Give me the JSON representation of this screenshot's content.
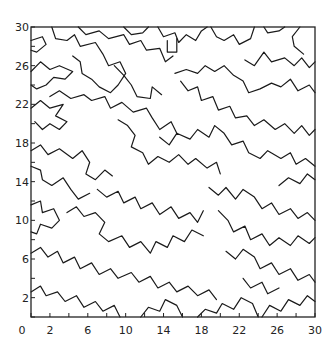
{
  "chart_data": {
    "type": "contour",
    "title": "",
    "xlabel": "",
    "ylabel": "",
    "xlim": [
      0,
      30
    ],
    "ylim": [
      0,
      30
    ],
    "grid": false,
    "legend": null,
    "x_ticks": [
      0,
      2,
      6,
      10,
      14,
      18,
      22,
      26,
      30
    ],
    "y_ticks": [
      2,
      6,
      10,
      14,
      18,
      22,
      26,
      30
    ],
    "x_tick_labels": [
      "0",
      "2",
      "6",
      "10",
      "14",
      "18",
      "22",
      "26",
      "30"
    ],
    "y_tick_labels": [
      "2",
      "6",
      "10",
      "14",
      "18",
      "22",
      "26",
      "30"
    ],
    "minor_tick_step": 2,
    "line_color": "#1a1a1a",
    "contours": [
      [
        [
          0,
          28.6
        ],
        [
          1.2,
          29
        ],
        [
          1.6,
          28.2
        ],
        [
          0.6,
          27.4
        ],
        [
          0,
          27.6
        ]
      ],
      [
        [
          0,
          25.4
        ],
        [
          1,
          26.4
        ],
        [
          2,
          25.6
        ],
        [
          3,
          26
        ],
        [
          4.4,
          25.4
        ],
        [
          3.6,
          24.6
        ],
        [
          2.4,
          24.8
        ],
        [
          1.6,
          24
        ],
        [
          0.6,
          23.6
        ],
        [
          0,
          24
        ]
      ],
      [
        [
          2.2,
          30
        ],
        [
          2.6,
          28.8
        ],
        [
          3.8,
          28.6
        ],
        [
          4.6,
          29.2
        ],
        [
          5.2,
          28
        ],
        [
          6.8,
          28.4
        ],
        [
          7.6,
          27.2
        ],
        [
          8.2,
          26
        ],
        [
          9.4,
          26.4
        ],
        [
          10,
          25.2
        ],
        [
          9.2,
          24
        ],
        [
          8.4,
          23.2
        ],
        [
          7.2,
          23.8
        ],
        [
          6.4,
          24.6
        ],
        [
          5.4,
          25.2
        ],
        [
          5.2,
          26.4
        ],
        [
          4.4,
          27
        ]
      ],
      [
        [
          5,
          30
        ],
        [
          5.8,
          29.2
        ],
        [
          7.2,
          29.6
        ],
        [
          8.2,
          28.8
        ],
        [
          9.8,
          29.2
        ],
        [
          10.4,
          28.2
        ],
        [
          11.6,
          28.6
        ],
        [
          12.2,
          27.6
        ],
        [
          13.6,
          27.8
        ],
        [
          14.2,
          26.4
        ],
        [
          15,
          27
        ]
      ],
      [
        [
          9.8,
          30
        ],
        [
          10.6,
          29.2
        ],
        [
          11.8,
          29.4
        ],
        [
          12.4,
          30
        ]
      ],
      [
        [
          13.4,
          30
        ],
        [
          14,
          29
        ],
        [
          15.2,
          29.4
        ],
        [
          15.6,
          28.4
        ],
        [
          16.4,
          29.2
        ],
        [
          17.4,
          28.6
        ],
        [
          18,
          29.6
        ],
        [
          18.6,
          30
        ]
      ],
      [
        [
          14.4,
          28.6
        ],
        [
          14.4,
          27.4
        ],
        [
          15.4,
          27.4
        ],
        [
          15.4,
          28.8
        ]
      ],
      [
        [
          19,
          30
        ],
        [
          19.6,
          29
        ],
        [
          20.4,
          28.6
        ],
        [
          21.4,
          29.2
        ],
        [
          22,
          28.2
        ],
        [
          23.2,
          28.8
        ],
        [
          23.6,
          30
        ]
      ],
      [
        [
          24.6,
          30
        ],
        [
          25,
          29.4
        ],
        [
          26.2,
          29.6
        ],
        [
          26.8,
          30
        ]
      ],
      [
        [
          28.4,
          30
        ],
        [
          27.6,
          29
        ],
        [
          27.8,
          28
        ],
        [
          28.8,
          27.2
        ]
      ],
      [
        [
          0,
          21.6
        ],
        [
          1,
          22.4
        ],
        [
          2,
          21.6
        ],
        [
          3.4,
          22
        ],
        [
          2.6,
          20.8
        ],
        [
          3.8,
          20.2
        ],
        [
          3,
          19.4
        ],
        [
          2,
          20
        ],
        [
          1.2,
          19.4
        ],
        [
          0.4,
          20.2
        ]
      ],
      [
        [
          2,
          22.8
        ],
        [
          3,
          23.4
        ],
        [
          4.2,
          22.6
        ],
        [
          5.6,
          23
        ],
        [
          6.4,
          22.4
        ],
        [
          7.8,
          22.8
        ],
        [
          8.4,
          21.6
        ],
        [
          9.6,
          22.2
        ],
        [
          10.8,
          21.2
        ],
        [
          12.2,
          21.6
        ],
        [
          12.8,
          20.6
        ],
        [
          13.6,
          19.4
        ],
        [
          14.8,
          20.2
        ],
        [
          15.4,
          19
        ]
      ],
      [
        [
          8.8,
          26
        ],
        [
          9.8,
          25
        ],
        [
          10.6,
          24
        ],
        [
          11.2,
          22.8
        ],
        [
          12.6,
          22.6
        ],
        [
          12.8,
          23.8
        ],
        [
          13.8,
          23
        ]
      ],
      [
        [
          15.2,
          25.2
        ],
        [
          16.4,
          25.6
        ],
        [
          17.6,
          25.2
        ],
        [
          18.4,
          26
        ],
        [
          19.4,
          25.4
        ],
        [
          20.4,
          26
        ],
        [
          21.4,
          25
        ],
        [
          22.4,
          24.4
        ],
        [
          23,
          23.2
        ],
        [
          24.2,
          23.6
        ],
        [
          25.4,
          24.2
        ],
        [
          26.4,
          23.8
        ],
        [
          27.4,
          24.6
        ],
        [
          28.2,
          23.4
        ],
        [
          29.4,
          24
        ],
        [
          30,
          23.2
        ]
      ],
      [
        [
          22.6,
          26.6
        ],
        [
          23.6,
          26
        ],
        [
          24.6,
          27.4
        ],
        [
          25.4,
          26.4
        ],
        [
          26.8,
          26.8
        ],
        [
          27.8,
          26
        ],
        [
          28.6,
          26.8
        ],
        [
          29.4,
          25.8
        ],
        [
          30,
          26.4
        ]
      ],
      [
        [
          15.8,
          24.4
        ],
        [
          16.6,
          23.4
        ],
        [
          17.6,
          23.8
        ],
        [
          18,
          22.4
        ],
        [
          19.2,
          22.8
        ],
        [
          19.8,
          21.4
        ],
        [
          21,
          21.8
        ],
        [
          21.6,
          20.6
        ],
        [
          22.8,
          20.8
        ],
        [
          23.6,
          19.8
        ],
        [
          24.6,
          20.4
        ],
        [
          25.8,
          19.4
        ],
        [
          26.8,
          20
        ],
        [
          27.8,
          19
        ],
        [
          28.6,
          19.8
        ],
        [
          29.4,
          18.8
        ],
        [
          30,
          19.4
        ]
      ],
      [
        [
          0,
          17.2
        ],
        [
          1,
          17.8
        ],
        [
          1.8,
          16.8
        ],
        [
          3,
          17.4
        ],
        [
          4.4,
          16.4
        ],
        [
          5.4,
          17.2
        ],
        [
          6.2,
          16
        ],
        [
          5.8,
          14.8
        ],
        [
          6.8,
          14.2
        ],
        [
          7.8,
          15.2
        ],
        [
          8.6,
          14.6
        ]
      ],
      [
        [
          0,
          15.6
        ],
        [
          1,
          15.2
        ],
        [
          1.2,
          14.2
        ],
        [
          2.2,
          13.6
        ],
        [
          3.4,
          14.4
        ],
        [
          4.2,
          13.2
        ],
        [
          5,
          12.2
        ],
        [
          6.2,
          12.8
        ]
      ],
      [
        [
          9.2,
          20.4
        ],
        [
          10.2,
          19.8
        ],
        [
          11,
          18.8
        ],
        [
          10.6,
          17.6
        ],
        [
          11.8,
          17
        ],
        [
          12.4,
          15.8
        ],
        [
          13.4,
          16.6
        ],
        [
          14.6,
          16
        ],
        [
          15.6,
          16.8
        ],
        [
          16.6,
          15.8
        ],
        [
          17.4,
          16.4
        ],
        [
          18.6,
          15.4
        ],
        [
          19.6,
          16
        ],
        [
          20,
          14.8
        ]
      ],
      [
        [
          13.6,
          18.6
        ],
        [
          14.6,
          17.8
        ],
        [
          15.4,
          19
        ],
        [
          16.8,
          18.4
        ],
        [
          17.6,
          19.4
        ],
        [
          18.8,
          18.6
        ],
        [
          19.4,
          19.8
        ],
        [
          20.4,
          19
        ],
        [
          21.2,
          17.8
        ],
        [
          22.4,
          18.2
        ],
        [
          23,
          17
        ],
        [
          24.2,
          16.4
        ],
        [
          25,
          17.2
        ],
        [
          26.4,
          16.4
        ],
        [
          27.4,
          17
        ],
        [
          28,
          15.8
        ],
        [
          29,
          16.4
        ],
        [
          30,
          15.6
        ]
      ],
      [
        [
          26.2,
          13.6
        ],
        [
          27.2,
          14.4
        ],
        [
          28.4,
          13.8
        ],
        [
          29.2,
          14.8
        ],
        [
          30,
          14.2
        ]
      ],
      [
        [
          0,
          11.6
        ],
        [
          1,
          12
        ],
        [
          1.2,
          10.8
        ],
        [
          2.4,
          11.2
        ],
        [
          3,
          10
        ],
        [
          2.2,
          9.2
        ],
        [
          1,
          9.6
        ],
        [
          0.6,
          8.6
        ],
        [
          0,
          8.8
        ]
      ],
      [
        [
          3.8,
          10.8
        ],
        [
          4.8,
          11.4
        ],
        [
          5.6,
          10.4
        ],
        [
          6.8,
          10.8
        ],
        [
          7.8,
          9.8
        ],
        [
          7.2,
          8.6
        ],
        [
          8.2,
          7.8
        ],
        [
          9.6,
          8.4
        ],
        [
          10.4,
          7.2
        ],
        [
          11.6,
          7.8
        ],
        [
          12.6,
          6.6
        ],
        [
          13.2,
          7.8
        ],
        [
          14.4,
          7.2
        ],
        [
          15,
          8.4
        ],
        [
          16.2,
          7.8
        ],
        [
          17,
          9
        ],
        [
          18.2,
          8.4
        ]
      ],
      [
        [
          7,
          13.2
        ],
        [
          8,
          12.4
        ],
        [
          9.2,
          13
        ],
        [
          9.8,
          11.8
        ],
        [
          11,
          12.4
        ],
        [
          11.6,
          11.2
        ],
        [
          12.8,
          11.8
        ],
        [
          13.6,
          10.6
        ],
        [
          14.8,
          11.4
        ],
        [
          15.6,
          10.2
        ],
        [
          16.8,
          10.8
        ],
        [
          17.6,
          9.8
        ],
        [
          18.2,
          11
        ]
      ],
      [
        [
          18.8,
          13.4
        ],
        [
          19.8,
          12.6
        ],
        [
          20.6,
          13.4
        ],
        [
          21.6,
          12.2
        ],
        [
          22.4,
          13.2
        ],
        [
          23.6,
          12.4
        ],
        [
          24.4,
          11.2
        ],
        [
          25.4,
          11.8
        ],
        [
          26.2,
          10.6
        ],
        [
          27.4,
          11.2
        ],
        [
          28.2,
          10.2
        ],
        [
          29.2,
          10.8
        ],
        [
          30,
          10
        ]
      ],
      [
        [
          19.8,
          11
        ],
        [
          20.8,
          10
        ],
        [
          21.4,
          8.8
        ],
        [
          22.6,
          9.4
        ],
        [
          23.2,
          8
        ],
        [
          24.4,
          8.6
        ],
        [
          25.2,
          7.4
        ],
        [
          26.2,
          8.2
        ],
        [
          27.4,
          7.4
        ],
        [
          28.2,
          8.4
        ],
        [
          29.4,
          7.6
        ],
        [
          30,
          8.2
        ]
      ],
      [
        [
          0,
          6.6
        ],
        [
          1,
          7.2
        ],
        [
          1.8,
          6.2
        ],
        [
          2.8,
          6.8
        ],
        [
          3.4,
          5.6
        ],
        [
          4.6,
          6.2
        ],
        [
          5.2,
          5
        ],
        [
          6.4,
          5.6
        ],
        [
          7.2,
          4.4
        ],
        [
          8.4,
          5
        ],
        [
          9.2,
          4
        ],
        [
          10.6,
          4.6
        ],
        [
          11.4,
          3.6
        ],
        [
          12.6,
          4.2
        ],
        [
          13.4,
          3
        ],
        [
          14.6,
          3.6
        ],
        [
          15.4,
          2.6
        ],
        [
          16.6,
          3.2
        ],
        [
          17.6,
          2.2
        ],
        [
          18.8,
          2.8
        ],
        [
          19.6,
          1.8
        ]
      ],
      [
        [
          0,
          2.6
        ],
        [
          1,
          3.2
        ],
        [
          1.6,
          2.2
        ],
        [
          2.8,
          2.6
        ],
        [
          3.6,
          1.6
        ],
        [
          4.8,
          2.2
        ],
        [
          5.6,
          1
        ],
        [
          6.8,
          1.6
        ],
        [
          7.6,
          0.6
        ],
        [
          8.8,
          1.2
        ],
        [
          9.4,
          0
        ]
      ],
      [
        [
          11.6,
          0
        ],
        [
          12.4,
          1
        ],
        [
          13.6,
          0.6
        ],
        [
          14.2,
          1.8
        ],
        [
          15.4,
          1.2
        ],
        [
          16,
          0
        ]
      ],
      [
        [
          17.6,
          0
        ],
        [
          18.4,
          0.8
        ],
        [
          19.6,
          0.4
        ],
        [
          20.2,
          1.4
        ],
        [
          21.4,
          0.8
        ],
        [
          22.2,
          2
        ],
        [
          23.4,
          1.4
        ],
        [
          24,
          0
        ]
      ],
      [
        [
          20.6,
          6.8
        ],
        [
          21.6,
          6
        ],
        [
          22.4,
          7
        ],
        [
          23.6,
          6.2
        ],
        [
          24.2,
          5
        ],
        [
          25.4,
          5.6
        ],
        [
          26.2,
          4.4
        ],
        [
          27.4,
          5
        ],
        [
          28.2,
          3.8
        ],
        [
          29.4,
          4.4
        ],
        [
          30,
          3.6
        ]
      ],
      [
        [
          24.4,
          0
        ],
        [
          25.2,
          1.2
        ],
        [
          26.4,
          0.6
        ],
        [
          27.2,
          1.8
        ],
        [
          28.4,
          1.2
        ],
        [
          29.2,
          2.2
        ],
        [
          30,
          1.6
        ]
      ],
      [
        [
          22.4,
          4
        ],
        [
          23.2,
          3
        ],
        [
          24.4,
          3.6
        ],
        [
          25,
          2.4
        ],
        [
          26.2,
          3
        ]
      ]
    ]
  }
}
